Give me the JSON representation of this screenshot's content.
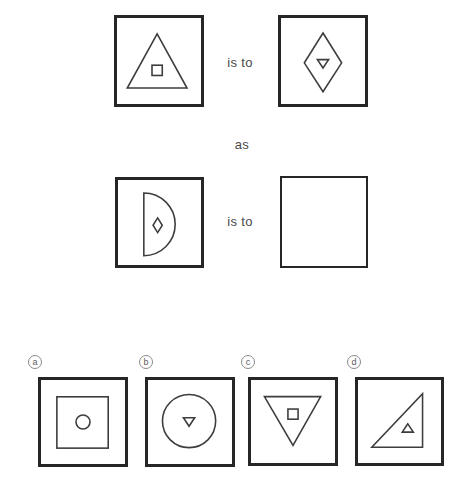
{
  "puzzle": {
    "analogy": {
      "row1": {
        "left": {
          "shape": "triangle-up",
          "inner": "square",
          "inner_at": [
            43,
            55
          ]
        },
        "relation": "is to",
        "right": {
          "shape": "diamond",
          "inner": "triangle-down",
          "inner_at": [
            45,
            48
          ]
        }
      },
      "connector": "as",
      "row2": {
        "left": {
          "shape": "half-circle-right",
          "inner": "diamond",
          "inner_at": [
            43,
            48
          ]
        },
        "relation": "is to",
        "right": {
          "shape": "none",
          "inner": "none",
          "inner_at": [
            45,
            45
          ]
        }
      }
    },
    "options": [
      {
        "label": "a",
        "figure": {
          "shape": "square",
          "inner": "circle",
          "inner_at": [
            45,
            45
          ]
        }
      },
      {
        "label": "b",
        "figure": {
          "shape": "circle",
          "inner": "triangle-down",
          "inner_at": [
            44,
            45
          ]
        }
      },
      {
        "label": "c",
        "figure": {
          "shape": "triangle-down",
          "inner": "square",
          "inner_at": [
            45,
            37
          ]
        }
      },
      {
        "label": "d",
        "figure": {
          "shape": "right-triangle",
          "inner": "triangle-up",
          "inner_at": [
            54,
            52
          ]
        }
      }
    ]
  },
  "colors": {
    "frame": "#262626",
    "shape": "#3d3d3d",
    "text": "#4a4a4a",
    "label_ring": "#8a8a8a",
    "label_text": "#5a5a5a",
    "background": "#ffffff"
  }
}
